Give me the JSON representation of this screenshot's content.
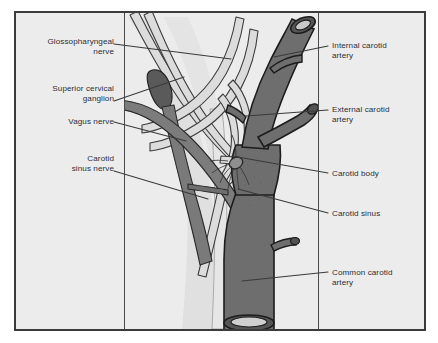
{
  "figure": {
    "background_color": "#ececec",
    "page_color": "#ffffff",
    "frame_color": "#3b3b3b",
    "rule_color": "#4a4a4a",
    "text_color": "#2b2f3a",
    "artery_fill": "#6e6e6e",
    "artery_outline": "#1c1c1c",
    "nerve_fill": "#d9d9d9",
    "nerve_outline": "#3c3c3c",
    "ganglion_fill": "#5a5a5a"
  },
  "labels": {
    "left": [
      {
        "id": "glossopharyngeal-nerve",
        "text": "Glossopharyngeal\nnerve"
      },
      {
        "id": "superior-cervical-ganglion",
        "text": "Superior cervical\nganglion"
      },
      {
        "id": "vagus-nerve",
        "text": "Vagus nerve"
      },
      {
        "id": "carotid-sinus-nerve",
        "text": "Carotid\nsinus nerve"
      }
    ],
    "right": [
      {
        "id": "internal-carotid-artery",
        "text": "Internal carotid\nartery"
      },
      {
        "id": "external-carotid-artery",
        "text": "External carotid\nartery"
      },
      {
        "id": "carotid-body",
        "text": "Carotid body"
      },
      {
        "id": "carotid-sinus",
        "text": "Carotid sinus"
      },
      {
        "id": "common-carotid-artery",
        "text": "Common carotid\nartery"
      }
    ]
  }
}
